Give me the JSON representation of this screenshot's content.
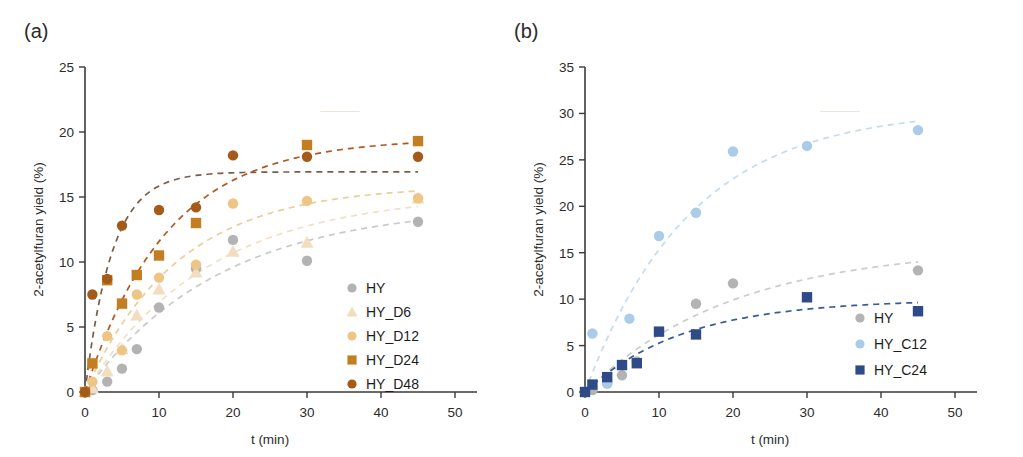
{
  "figure": {
    "panels": [
      {
        "id": "a",
        "label": "(a)",
        "chart_data": {
          "type": "scatter",
          "title": "",
          "xlabel": "t (min)",
          "ylabel": "2-acetylfuran yield (%)",
          "xlim": [
            0,
            50
          ],
          "ylim": [
            0,
            25
          ],
          "xticks": [
            0,
            10,
            20,
            30,
            40,
            50
          ],
          "yticks": [
            0,
            5,
            10,
            15,
            20,
            25
          ],
          "grid": false,
          "legend_position": "lower-right",
          "series": [
            {
              "name": "HY",
              "marker": "circle",
              "color": "#b3b3b3",
              "fit_color": "#c9c9c9",
              "points": [
                {
                  "x": 0,
                  "y": 0.0
                },
                {
                  "x": 1,
                  "y": 0.15
                },
                {
                  "x": 3,
                  "y": 0.8
                },
                {
                  "x": 5,
                  "y": 1.8
                },
                {
                  "x": 7,
                  "y": 3.3
                },
                {
                  "x": 10,
                  "y": 6.5
                },
                {
                  "x": 15,
                  "y": 9.5
                },
                {
                  "x": 20,
                  "y": 11.7
                },
                {
                  "x": 30,
                  "y": 10.1
                },
                {
                  "x": 45,
                  "y": 13.1
                }
              ]
            },
            {
              "name": "HY_D6",
              "marker": "triangle",
              "color": "#f2ddbe",
              "fit_color": "#efe0c8",
              "points": [
                {
                  "x": 0,
                  "y": 0.0
                },
                {
                  "x": 1,
                  "y": 0.3
                },
                {
                  "x": 3,
                  "y": 1.6
                },
                {
                  "x": 5,
                  "y": 3.3
                },
                {
                  "x": 7,
                  "y": 5.9
                },
                {
                  "x": 10,
                  "y": 7.9
                },
                {
                  "x": 15,
                  "y": 9.2
                },
                {
                  "x": 20,
                  "y": 10.8
                },
                {
                  "x": 30,
                  "y": 11.5
                },
                {
                  "x": 45,
                  "y": 14.9
                }
              ]
            },
            {
              "name": "HY_D12",
              "marker": "circle",
              "color": "#eec584",
              "fit_color": "#eecb97",
              "points": [
                {
                  "x": 0,
                  "y": 0.0
                },
                {
                  "x": 1,
                  "y": 0.8
                },
                {
                  "x": 3,
                  "y": 4.3
                },
                {
                  "x": 5,
                  "y": 3.2
                },
                {
                  "x": 7,
                  "y": 7.5
                },
                {
                  "x": 10,
                  "y": 8.8
                },
                {
                  "x": 15,
                  "y": 9.8
                },
                {
                  "x": 20,
                  "y": 14.5
                },
                {
                  "x": 30,
                  "y": 14.7
                },
                {
                  "x": 45,
                  "y": 14.9
                }
              ]
            },
            {
              "name": "HY_D24",
              "marker": "square",
              "color": "#c47e22",
              "fit_color": "#b5561e",
              "points": [
                {
                  "x": 0,
                  "y": 0.0
                },
                {
                  "x": 1,
                  "y": 2.2
                },
                {
                  "x": 3,
                  "y": 8.6
                },
                {
                  "x": 5,
                  "y": 6.8
                },
                {
                  "x": 7,
                  "y": 9.0
                },
                {
                  "x": 10,
                  "y": 10.5
                },
                {
                  "x": 15,
                  "y": 13.0
                },
                {
                  "x": 30,
                  "y": 19.0
                },
                {
                  "x": 45,
                  "y": 19.3
                }
              ]
            },
            {
              "name": "HY_D48",
              "marker": "circle",
              "color": "#a55b17",
              "fit_color": "#7d5c46",
              "points": [
                {
                  "x": 0,
                  "y": 0.0
                },
                {
                  "x": 1,
                  "y": 7.5
                },
                {
                  "x": 3,
                  "y": 8.7
                },
                {
                  "x": 5,
                  "y": 12.8
                },
                {
                  "x": 10,
                  "y": 14.0
                },
                {
                  "x": 15,
                  "y": 14.2
                },
                {
                  "x": 20,
                  "y": 18.2
                },
                {
                  "x": 30,
                  "y": 18.1
                },
                {
                  "x": 45,
                  "y": 18.1
                }
              ]
            }
          ]
        }
      },
      {
        "id": "b",
        "label": "(b)",
        "chart_data": {
          "type": "scatter",
          "title": "",
          "xlabel": "t (min)",
          "ylabel": "2-acetylfuran yield (%)",
          "xlim": [
            0,
            50
          ],
          "ylim": [
            0,
            35
          ],
          "xticks": [
            0,
            10,
            20,
            30,
            40,
            50
          ],
          "yticks": [
            0,
            5,
            10,
            15,
            20,
            25,
            30,
            35
          ],
          "grid": false,
          "legend_position": "lower-right",
          "series": [
            {
              "name": "HY",
              "marker": "circle",
              "color": "#b3b3b3",
              "fit_color": "#cccccc",
              "points": [
                {
                  "x": 0,
                  "y": 0.0
                },
                {
                  "x": 1,
                  "y": 0.2
                },
                {
                  "x": 3,
                  "y": 0.9
                },
                {
                  "x": 5,
                  "y": 1.8
                },
                {
                  "x": 7,
                  "y": 3.3
                },
                {
                  "x": 15,
                  "y": 9.5
                },
                {
                  "x": 20,
                  "y": 11.7
                },
                {
                  "x": 45,
                  "y": 13.1
                }
              ]
            },
            {
              "name": "HY_C12",
              "marker": "circle",
              "color": "#aacce8",
              "fit_color": "#c3dcee",
              "points": [
                {
                  "x": 0,
                  "y": 0.0
                },
                {
                  "x": 1,
                  "y": 6.3
                },
                {
                  "x": 3,
                  "y": 1.0
                },
                {
                  "x": 6,
                  "y": 7.9
                },
                {
                  "x": 10,
                  "y": 16.8
                },
                {
                  "x": 15,
                  "y": 19.3
                },
                {
                  "x": 20,
                  "y": 25.9
                },
                {
                  "x": 30,
                  "y": 26.5
                },
                {
                  "x": 45,
                  "y": 28.2
                }
              ]
            },
            {
              "name": "HY_C24",
              "marker": "square",
              "color": "#2e4b87",
              "fit_color": "#3a5a9a",
              "points": [
                {
                  "x": 0,
                  "y": 0.0
                },
                {
                  "x": 1,
                  "y": 0.8
                },
                {
                  "x": 3,
                  "y": 1.6
                },
                {
                  "x": 5,
                  "y": 2.9
                },
                {
                  "x": 7,
                  "y": 3.1
                },
                {
                  "x": 10,
                  "y": 6.5
                },
                {
                  "x": 15,
                  "y": 6.2
                },
                {
                  "x": 30,
                  "y": 10.2
                },
                {
                  "x": 45,
                  "y": 8.7
                }
              ]
            }
          ]
        }
      }
    ]
  }
}
